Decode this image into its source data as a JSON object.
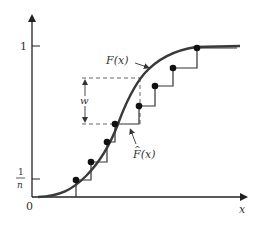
{
  "figure": {
    "y_axis": {
      "tick_1_label": "1",
      "tick_1n_numerator": "1",
      "tick_1n_denominator": "n"
    },
    "x_axis": {
      "label": "x",
      "origin_label": "0"
    },
    "curves": {
      "true_cdf_label": "F(x)",
      "empirical_cdf_label": "F(x)",
      "empirical_cdf_hat": "^"
    },
    "annotation": {
      "gap_label": "w"
    },
    "colors": {
      "curve": "#3a3a3a",
      "steps": "#333333",
      "axes": "#222222",
      "dashed": "#555555"
    },
    "empirical_points": [
      {
        "x": 76,
        "y": 180
      },
      {
        "x": 91,
        "y": 162
      },
      {
        "x": 107,
        "y": 142
      },
      {
        "x": 115,
        "y": 124
      },
      {
        "x": 139,
        "y": 106
      },
      {
        "x": 155,
        "y": 86
      },
      {
        "x": 173,
        "y": 68
      },
      {
        "x": 197,
        "y": 48
      }
    ]
  }
}
